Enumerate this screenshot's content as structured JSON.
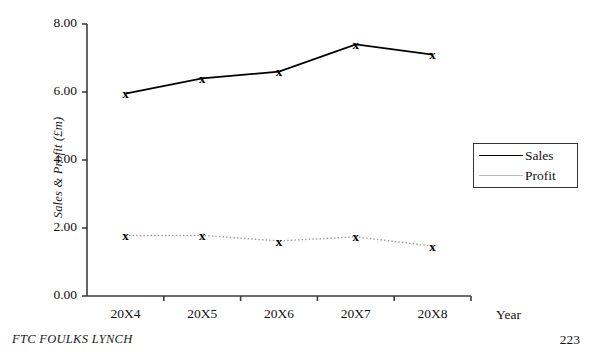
{
  "chart_data": {
    "type": "line",
    "title": "",
    "xlabel": "Year",
    "ylabel": "Sales & Profit (£m)",
    "categories": [
      "20X4",
      "20X5",
      "20X6",
      "20X7",
      "20X8"
    ],
    "series": [
      {
        "name": "Sales",
        "values": [
          5.95,
          6.4,
          6.6,
          7.4,
          7.1
        ],
        "color": "#000000",
        "line_style": "solid",
        "marker": "x"
      },
      {
        "name": "Profit",
        "values": [
          1.78,
          1.78,
          1.62,
          1.74,
          1.47
        ],
        "color": "#9a9a9e",
        "line_style": "dotted",
        "marker": "x"
      }
    ],
    "ylim": [
      0.0,
      8.0
    ],
    "y_ticks": [
      "0.00",
      "2.00",
      "4.00",
      "6.00",
      "8.00"
    ],
    "y_tick_values": [
      0.0,
      2.0,
      4.0,
      6.0,
      8.0
    ],
    "grid": false,
    "legend_position": "right"
  },
  "legend": {
    "entries": [
      {
        "label": "Sales"
      },
      {
        "label": "Profit"
      }
    ]
  },
  "footer": {
    "source": "FTC FOULKS LYNCH",
    "page_number": "223"
  }
}
